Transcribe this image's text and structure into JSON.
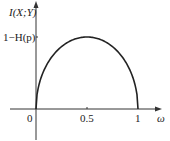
{
  "chart_data": {
    "type": "line",
    "title": "",
    "xlabel": "ω",
    "ylabel": "I(X;Y)",
    "x_ticks": [
      "0",
      "0.5",
      "1"
    ],
    "y_ticks": [
      "1−H(p)"
    ],
    "series": [
      {
        "name": "I(X;Y)",
        "x": [
          0,
          0.05,
          0.1,
          0.2,
          0.3,
          0.4,
          0.5,
          0.6,
          0.7,
          0.8,
          0.9,
          0.95,
          1
        ],
        "values": [
          0,
          0.44,
          0.6,
          0.8,
          0.92,
          0.98,
          1.0,
          0.98,
          0.92,
          0.8,
          0.6,
          0.44,
          0
        ]
      }
    ],
    "xlim": [
      0,
      1
    ],
    "ylim": [
      0,
      1
    ],
    "grid": false,
    "annotations": [
      "peak value 1−H(p) at ω = 0.5"
    ]
  },
  "labels": {
    "y_axis": "I(X;Y)",
    "y_tick": "1−H(p)",
    "x_tick_0": "0",
    "x_tick_mid": "0.5",
    "x_tick_1": "1",
    "x_axis": "ω"
  },
  "colors": {
    "axis": "#333333",
    "curve": "#222222"
  }
}
